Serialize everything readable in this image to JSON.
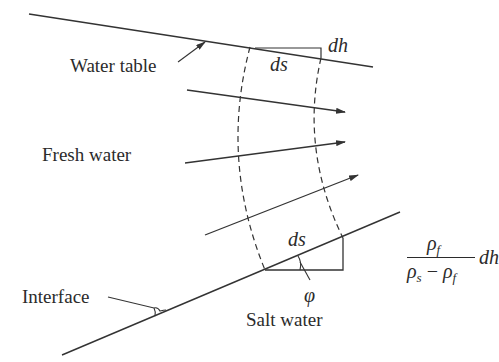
{
  "figure": {
    "type": "Dupuit-Ghyben-Herzberg freshwater/saltwater interface diagram",
    "colors": {
      "stroke": "#333333",
      "text": "#2b2b2b",
      "background": "#ffffff"
    }
  },
  "labels": {
    "water_table": "Water table",
    "fresh_water": "Fresh water",
    "interface": "Interface",
    "salt_water": "Salt water",
    "ds_top": "ds",
    "dh_top": "dh",
    "ds_bottom": "ds",
    "phi": "φ"
  },
  "formula": {
    "numerator": "ρf",
    "numerator_base": "ρ",
    "numerator_sub": "f",
    "denominator_base1": "ρ",
    "denominator_sub1": "s",
    "denominator_minus": " − ",
    "denominator_base2": "ρ",
    "denominator_sub2": "f",
    "multiplier": "dh"
  },
  "geometry": {
    "water_table_line": [
      [
        29,
        14
      ],
      [
        373,
        67
      ]
    ],
    "interface_line": [
      [
        62,
        355
      ],
      [
        400,
        212
      ]
    ],
    "flow_arrows": [
      [
        [
          187,
          90
        ],
        [
          345,
          112
        ]
      ],
      [
        [
          185,
          163
        ],
        [
          345,
          142
        ]
      ],
      [
        [
          205,
          235
        ],
        [
          358,
          175
        ]
      ]
    ],
    "dashed_boundaries": 2
  }
}
